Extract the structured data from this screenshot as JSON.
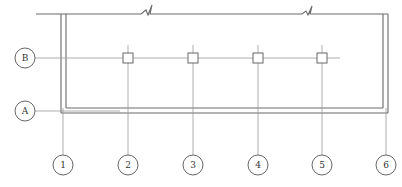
{
  "drawing": {
    "title": "Structural grid plan with break lines",
    "horizontal_axes": [
      {
        "label": "B",
        "has_columns": true
      },
      {
        "label": "A",
        "has_columns": false
      }
    ],
    "vertical_axes": [
      {
        "label": "1"
      },
      {
        "label": "2"
      },
      {
        "label": "3"
      },
      {
        "label": "4"
      },
      {
        "label": "5"
      },
      {
        "label": "6"
      }
    ],
    "columns_on_axis_B": [
      "2",
      "3",
      "4",
      "5"
    ],
    "break_symbols": 2,
    "colors": {
      "wall": "#6a6a6a",
      "axis": "#9a9a9a",
      "bubble": "#555555",
      "text": "#333333"
    }
  }
}
